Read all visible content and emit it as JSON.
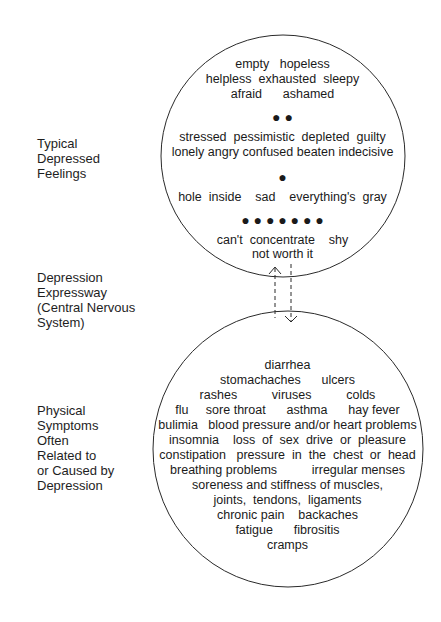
{
  "side_labels": {
    "feelings": [
      "Typical",
      "Depressed",
      "Feelings"
    ],
    "expressway": [
      "Depression",
      "Expressway",
      "(Central Nervous",
      "System)"
    ],
    "physical": [
      "Physical",
      "Symptoms",
      "Often",
      "Related to",
      "or Caused by",
      "Depression"
    ]
  },
  "top_circle": {
    "lines": [
      "empty   hopeless",
      "helpless  exhausted  sleepy",
      "afraid      ashamed",
      "stressed  pessimistic  depleted  guilty",
      "lonely angry confused beaten indecisive",
      "hole  inside    sad    everything's  gray",
      "can't  concentrate    shy",
      "not worth it"
    ],
    "dot_rows": [
      "●              ●",
      "●",
      "● ● ● ● ● ● ●"
    ]
  },
  "connector": {
    "left_arrow": "up-arrow",
    "right_arrow": "down-arrow"
  },
  "bottom_circle": {
    "lines": [
      "diarrhea",
      "stomachaches      ulcers",
      "rashes          viruses          colds",
      "flu     sore throat      asthma      hay fever",
      "bulimia   blood pressure and/or heart problems",
      "insomnia    loss  of  sex  drive  or  pleasure",
      "constipation   pressure  in  the  chest  or  head",
      "breathing problems          irregular menses",
      "soreness and stiffness of muscles,",
      "joints,  tendons,  ligaments",
      "chronic pain    backaches",
      "fatigue      fibrositis",
      "cramps"
    ]
  }
}
